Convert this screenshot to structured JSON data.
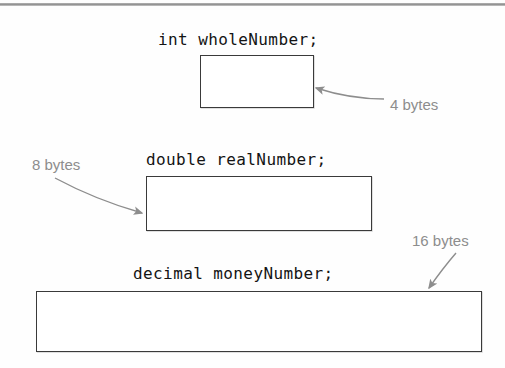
{
  "figure": {
    "accent_line_color": "#8e8e8e",
    "box_border_color": "#3a3a3a",
    "annotation_color": "#8d8d8d",
    "code_color": "#141414"
  },
  "rows": [
    {
      "declaration": "int wholeNumber;",
      "annotation": "4 bytes",
      "bytes": 4,
      "box": {
        "x": 200,
        "y": 55,
        "width": 114,
        "height": 53
      },
      "label_pos": {
        "x": 158,
        "y": 30
      },
      "annot_pos": {
        "x": 390,
        "y": 96
      },
      "arrow": {
        "from_x": 384,
        "from_y": 99,
        "ctrl_x": 350,
        "ctrl_y": 99,
        "to_x": 316,
        "to_y": 88
      }
    },
    {
      "declaration": "double realNumber;",
      "annotation": "8 bytes",
      "bytes": 8,
      "box": {
        "x": 146,
        "y": 176,
        "width": 226,
        "height": 55
      },
      "label_pos": {
        "x": 146,
        "y": 150
      },
      "annot_pos": {
        "x": 32,
        "y": 156
      },
      "arrow": {
        "from_x": 55,
        "from_y": 178,
        "ctrl_x": 96,
        "ctrl_y": 200,
        "to_x": 142,
        "to_y": 213
      }
    },
    {
      "declaration": "decimal moneyNumber;",
      "annotation": "16 bytes",
      "bytes": 16,
      "box": {
        "x": 36,
        "y": 291,
        "width": 446,
        "height": 61
      },
      "label_pos": {
        "x": 133,
        "y": 264
      },
      "annot_pos": {
        "x": 412,
        "y": 232
      },
      "arrow": {
        "from_x": 456,
        "from_y": 253,
        "ctrl_x": 443,
        "ctrl_y": 268,
        "to_x": 429,
        "to_y": 288
      }
    }
  ]
}
